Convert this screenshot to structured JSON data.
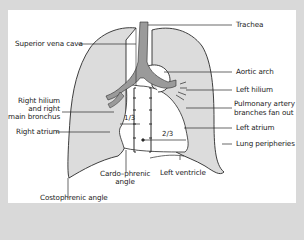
{
  "diagram": {
    "type": "chest-x-ray-schematic",
    "colors": {
      "frame": "#d9d9d9",
      "panel": "#ffffff",
      "lung_fill": "#dcdcdc",
      "airway_fill": "#9a9a9a",
      "outline": "#2a2a2a"
    },
    "labels": {
      "trachea": "Trachea",
      "superior_vena_cava": "Superior vena cava",
      "aortic_arch": "Aortic arch",
      "left_hilium": "Left hilium",
      "pulmonary_artery_line1": "Pulmonary artery",
      "pulmonary_artery_line2": "branches fan out",
      "right_hilium_line1": "Right hilium",
      "right_hilium_line2": "and right",
      "right_hilium_line3": "main bronchus",
      "right_atrium": "Right atrium",
      "left_atrium": "Left atrium",
      "lung_peripheries": "Lung peripheries",
      "cardio_phrenic_line1": "Cardo–phrenic",
      "cardio_phrenic_line2": "angle",
      "left_ventricle": "Left ventricle",
      "costophrenic_angle": "Costophrenic angle"
    },
    "fractions": {
      "one_third": "1/3",
      "two_thirds": "2/3"
    }
  }
}
